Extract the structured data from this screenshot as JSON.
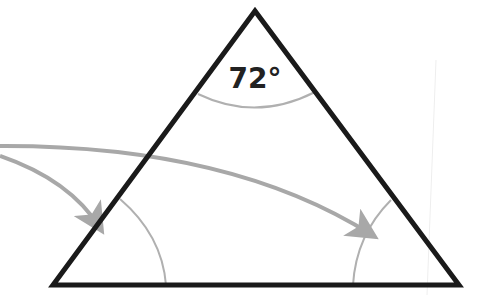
{
  "diagram": {
    "type": "triangle",
    "labels": {
      "apex_angle": "72°"
    },
    "colors": {
      "outline": "#1a1a1a",
      "arc": "#b0b0b0",
      "arrow": "#a8a8a8",
      "background": "#ffffff"
    },
    "vertices": {
      "apex": [
        255,
        11
      ],
      "bottom_left": [
        53,
        285
      ],
      "bottom_right": [
        459,
        285
      ]
    },
    "arrows": [
      {
        "name": "arrow-to-left-angle",
        "target": "bottom-left angle"
      },
      {
        "name": "arrow-to-right-angle",
        "target": "bottom-right angle"
      }
    ]
  }
}
